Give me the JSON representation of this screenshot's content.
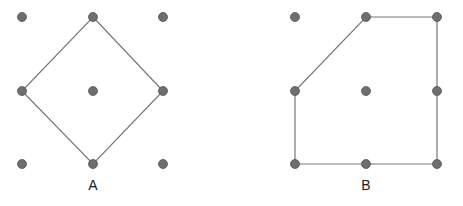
{
  "figure": {
    "background_color": "#ffffff",
    "dot_color": "#6e6e6e",
    "dot_stroke_color": "#555555",
    "dot_radius": 4.5,
    "edge_color": "#767676",
    "edge_width": 1.2,
    "label_color": "#1b1b1b",
    "grid_spacing_x": 71,
    "grid_spacing_y": 73.5
  },
  "panels": [
    {
      "id": "A",
      "label": "A",
      "label_position": {
        "x": 93,
        "y": 190
      },
      "shape_name": "diamond",
      "grid_points": [
        {
          "name": "top-left",
          "x": 22,
          "y": 17
        },
        {
          "name": "top-middle",
          "x": 93,
          "y": 17
        },
        {
          "name": "top-right",
          "x": 163,
          "y": 17
        },
        {
          "name": "middle-left",
          "x": 22,
          "y": 91
        },
        {
          "name": "center",
          "x": 93,
          "y": 91
        },
        {
          "name": "middle-right",
          "x": 163,
          "y": 91
        },
        {
          "name": "bottom-left",
          "x": 22,
          "y": 164
        },
        {
          "name": "bottom-middle",
          "x": 93,
          "y": 164
        },
        {
          "name": "bottom-right",
          "x": 163,
          "y": 164
        }
      ],
      "polygon_vertices": [
        {
          "name": "top-middle",
          "x": 93,
          "y": 17
        },
        {
          "name": "middle-right",
          "x": 163,
          "y": 91
        },
        {
          "name": "bottom-middle",
          "x": 93,
          "y": 164
        },
        {
          "name": "middle-left",
          "x": 22,
          "y": 91
        }
      ],
      "polygon_points": "93,17 163,91 93,164 22,91"
    },
    {
      "id": "B",
      "label": "B",
      "label_position": {
        "x": 366,
        "y": 190
      },
      "shape_name": "clipped-square-pentagon",
      "grid_points": [
        {
          "name": "top-left",
          "x": 295,
          "y": 17
        },
        {
          "name": "top-middle",
          "x": 366,
          "y": 17
        },
        {
          "name": "top-right",
          "x": 437,
          "y": 17
        },
        {
          "name": "middle-left",
          "x": 295,
          "y": 91
        },
        {
          "name": "center",
          "x": 366,
          "y": 91
        },
        {
          "name": "middle-right",
          "x": 437,
          "y": 91
        },
        {
          "name": "bottom-left",
          "x": 295,
          "y": 164
        },
        {
          "name": "bottom-middle",
          "x": 366,
          "y": 164
        },
        {
          "name": "bottom-right",
          "x": 437,
          "y": 164
        }
      ],
      "polygon_vertices": [
        {
          "name": "top-middle",
          "x": 366,
          "y": 17
        },
        {
          "name": "top-right",
          "x": 437,
          "y": 17
        },
        {
          "name": "bottom-right",
          "x": 437,
          "y": 164
        },
        {
          "name": "bottom-left",
          "x": 295,
          "y": 164
        },
        {
          "name": "middle-left",
          "x": 295,
          "y": 91
        }
      ],
      "polygon_points": "366,17 437,17 437,164 295,164 295,91"
    }
  ]
}
